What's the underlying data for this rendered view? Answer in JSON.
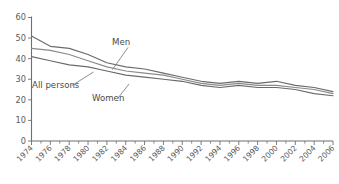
{
  "chart_data": {
    "type": "line",
    "title": "",
    "subtitle": "",
    "xlabel": "",
    "ylabel": "",
    "xlim": [
      1974,
      2006
    ],
    "ylim": [
      0,
      60
    ],
    "yticks": [
      0,
      10,
      20,
      30,
      40,
      50,
      60
    ],
    "ytick_labels": [
      "0",
      "10",
      "20",
      "30",
      "40",
      "50",
      "60"
    ],
    "grid": false,
    "legend_position": "inline-annotations",
    "x": [
      1974,
      1976,
      1978,
      1980,
      1982,
      1984,
      1986,
      1988,
      1990,
      1992,
      1994,
      1996,
      1998,
      2000,
      2002,
      2004,
      2006
    ],
    "xtick_labels": [
      "1974",
      "1976",
      "1978",
      "1980",
      "1982",
      "1984",
      "1986",
      "1988",
      "1990",
      "1992",
      "1994",
      "1996",
      "1998",
      "2000",
      "2002",
      "2004",
      "2006"
    ],
    "minor_ticks_every_year": true,
    "series": [
      {
        "name": "Men",
        "color": "#6b6b6b",
        "values": [
          51,
          46,
          45,
          42,
          38,
          36,
          35,
          33,
          31,
          29,
          28,
          29,
          28,
          29,
          27,
          26,
          24
        ]
      },
      {
        "name": "All persons",
        "color": "#8a8a8a",
        "values": [
          45,
          44,
          42,
          39,
          36,
          34,
          33,
          32,
          30,
          28,
          27,
          28,
          27,
          27,
          26,
          25,
          23
        ]
      },
      {
        "name": "Women",
        "color": "#6b6b6b",
        "values": [
          41,
          39,
          37,
          36,
          34,
          32,
          31,
          30,
          29,
          27,
          26,
          27,
          26,
          26,
          25,
          23,
          22
        ]
      }
    ],
    "annotations": [
      {
        "label": "Men",
        "x_px": 112,
        "y_px": 45
      },
      {
        "label": "All persons",
        "x_px": 32,
        "y_px": 88
      },
      {
        "label": "Women",
        "x_px": 92,
        "y_px": 101
      }
    ]
  },
  "axes": {
    "y_tick_values": [
      "60",
      "50",
      "40",
      "30",
      "20",
      "10",
      "0"
    ],
    "x_tick_values": [
      "1974",
      "1976",
      "1978",
      "1980",
      "1982",
      "1984",
      "1986",
      "1988",
      "1990",
      "1992",
      "1994",
      "1996",
      "1998",
      "2000",
      "2002",
      "2004",
      "2006"
    ]
  },
  "labels": {
    "men": "Men",
    "all_persons": "All persons",
    "women": "Women"
  },
  "colors": {
    "axis": "#6f6f6f",
    "text": "#5a5a5a",
    "series_dark": "#6b6b6b",
    "series_mid": "#8a8a8a",
    "background": "#ffffff"
  }
}
